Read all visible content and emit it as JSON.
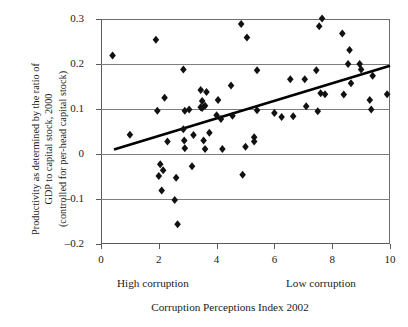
{
  "chart_data": {
    "type": "scatter",
    "title": "",
    "xlabel": "Corruption Perceptions Index 2002",
    "ylabel": "Productivity as determined by the ratio of GDP to capital stock, 2000 (controlled for per-head capital stock)",
    "ylabel_lines": [
      "Productivity as determined by the ratio of",
      "GDP to capital stock, 2000",
      "(controlled for per-head capital stock)"
    ],
    "xlim": [
      0,
      10
    ],
    "ylim": [
      -0.2,
      0.3
    ],
    "xticks": [
      "0",
      "2",
      "4",
      "6",
      "8",
      "10"
    ],
    "xtick_values": [
      0,
      2,
      4,
      6,
      8,
      10
    ],
    "yticks": [
      "0.3",
      "0.2",
      "0.1",
      "0",
      "–0.1",
      "–0.2"
    ],
    "ytick_values": [
      0.3,
      0.2,
      0.1,
      0,
      -0.1,
      -0.2
    ],
    "grid": true,
    "gridlines_y": [
      0.2,
      0.1,
      0,
      -0.1
    ],
    "legend": null,
    "annotations": [
      {
        "text": "High corruption",
        "position": "below-axis-left"
      },
      {
        "text": "Low corruption",
        "position": "below-axis-right"
      }
    ],
    "marker": {
      "shape": "diamond",
      "color": "#111111",
      "size": 4
    },
    "points": [
      [
        0.4,
        0.219
      ],
      [
        1.0,
        0.043
      ],
      [
        1.9,
        0.254
      ],
      [
        1.95,
        0.096
      ],
      [
        2.0,
        -0.049
      ],
      [
        2.05,
        -0.023
      ],
      [
        2.15,
        -0.036
      ],
      [
        2.1,
        -0.081
      ],
      [
        2.2,
        0.125
      ],
      [
        2.3,
        0.028
      ],
      [
        2.55,
        -0.102
      ],
      [
        2.6,
        -0.053
      ],
      [
        2.65,
        -0.156
      ],
      [
        2.85,
        0.188
      ],
      [
        2.85,
        0.055
      ],
      [
        2.9,
        0.096
      ],
      [
        2.88,
        0.03
      ],
      [
        2.9,
        0.013
      ],
      [
        3.05,
        0.099
      ],
      [
        3.15,
        -0.027
      ],
      [
        3.2,
        0.042
      ],
      [
        3.45,
        0.104
      ],
      [
        3.5,
        0.118
      ],
      [
        3.5,
        0.102
      ],
      [
        3.55,
        0.03
      ],
      [
        3.6,
        0.107
      ],
      [
        3.65,
        0.138
      ],
      [
        3.6,
        0.011
      ],
      [
        3.45,
        0.142
      ],
      [
        3.75,
        0.047
      ],
      [
        4.0,
        0.086
      ],
      [
        4.05,
        0.12
      ],
      [
        4.15,
        0.078
      ],
      [
        4.2,
        0.011
      ],
      [
        4.5,
        0.152
      ],
      [
        4.55,
        0.085
      ],
      [
        4.85,
        0.289
      ],
      [
        4.9,
        -0.046
      ],
      [
        5.0,
        0.016
      ],
      [
        5.05,
        0.259
      ],
      [
        5.3,
        0.037
      ],
      [
        5.3,
        0.028
      ],
      [
        5.4,
        0.186
      ],
      [
        5.4,
        0.097
      ],
      [
        6.0,
        0.091
      ],
      [
        6.25,
        0.082
      ],
      [
        6.55,
        0.166
      ],
      [
        6.65,
        0.084
      ],
      [
        7.05,
        0.166
      ],
      [
        7.1,
        0.106
      ],
      [
        7.45,
        0.186
      ],
      [
        7.5,
        0.095
      ],
      [
        7.55,
        0.284
      ],
      [
        7.6,
        0.135
      ],
      [
        7.65,
        0.301
      ],
      [
        7.75,
        0.133
      ],
      [
        8.35,
        0.268
      ],
      [
        8.4,
        0.132
      ],
      [
        8.55,
        0.2
      ],
      [
        8.6,
        0.231
      ],
      [
        8.65,
        0.157
      ],
      [
        8.95,
        0.2
      ],
      [
        9.0,
        0.188
      ],
      [
        9.3,
        0.12
      ],
      [
        9.35,
        0.099
      ],
      [
        9.4,
        0.174
      ],
      [
        9.9,
        0.133
      ]
    ],
    "trendline": {
      "x_start": 0.45,
      "y_start": 0.01,
      "x_end": 10.0,
      "y_end": 0.196,
      "color": "#000000",
      "width": 2.6
    }
  }
}
